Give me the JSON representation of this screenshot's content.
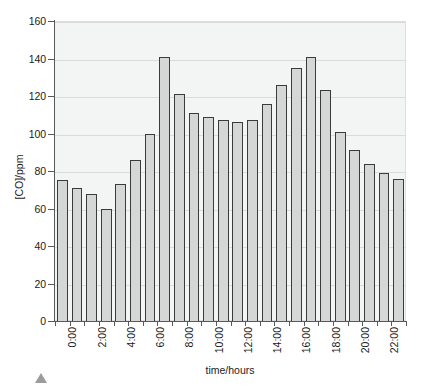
{
  "top_clip": {
    "fragment_a": "",
    "fragment_b": "",
    "fragment_c": ""
  },
  "axis": {
    "y_title": "[CO]/ppm",
    "x_title": "time/hours",
    "y_ticks": [
      "0",
      "20",
      "40",
      "60",
      "80",
      "100",
      "120",
      "140",
      "160"
    ]
  },
  "artifact": {
    "name": "mouse-cursor-triangle"
  },
  "chart_data": {
    "type": "bar",
    "title": "",
    "xlabel": "time/hours",
    "ylabel": "[CO]/ppm",
    "ylim": [
      0,
      160
    ],
    "ytick_step": 20,
    "grid": true,
    "legend": false,
    "categories": [
      "0:00",
      "1:00",
      "2:00",
      "3:00",
      "4:00",
      "5:00",
      "6:00",
      "7:00",
      "8:00",
      "9:00",
      "10:00",
      "11:00",
      "12:00",
      "13:00",
      "14:00",
      "15:00",
      "16:00",
      "17:00",
      "18:00",
      "19:00",
      "20:00",
      "21:00",
      "22:00",
      "23:00"
    ],
    "tick_labels_shown": [
      "0:00",
      "2:00",
      "4:00",
      "6:00",
      "8:00",
      "10:00",
      "12:00",
      "14:00",
      "16:00",
      "18:00",
      "20:00",
      "22:00"
    ],
    "values": [
      75,
      71,
      68,
      60,
      73,
      86,
      100,
      141,
      121,
      111,
      109,
      107,
      106,
      107,
      116,
      126,
      135,
      141,
      123,
      101,
      91,
      84,
      79,
      76
    ],
    "bar_fill": "#d5d6d6",
    "bar_edge": "#3b3b3d",
    "plot_background": "#f3f4f4"
  }
}
